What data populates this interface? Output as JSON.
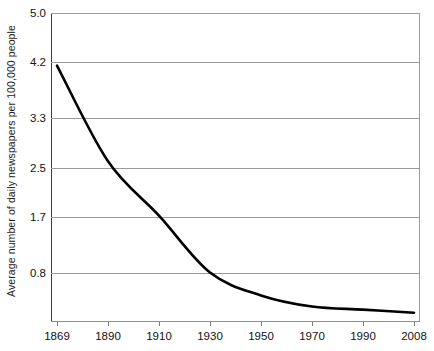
{
  "chart_data": {
    "type": "line",
    "title": "",
    "xlabel": "",
    "ylabel": "Average number of daily newspapers per 100,000 people",
    "x": [
      1869,
      1890,
      1910,
      1930,
      1950,
      1970,
      1990,
      2008
    ],
    "xtick_labels": [
      "1869",
      "1890",
      "1910",
      "1930",
      "1950",
      "1970",
      "1990",
      "2008"
    ],
    "values": [
      4.15,
      2.6,
      1.72,
      0.8,
      0.43,
      0.25,
      0.2,
      0.15
    ],
    "ytick_labels": [
      "5.0",
      "4.2",
      "3.3",
      "2.5",
      "1.7",
      "0.8"
    ],
    "ytick_values": [
      5.0,
      4.2,
      3.3,
      2.5,
      1.7,
      0.8
    ],
    "ylim": [
      0.0,
      5.0
    ],
    "xlim": [
      1869,
      2008
    ],
    "grid": true,
    "legend": null,
    "series_color": "#000000",
    "grid_color": "#9a9a9a",
    "axis_color": "#3c3c3c"
  }
}
